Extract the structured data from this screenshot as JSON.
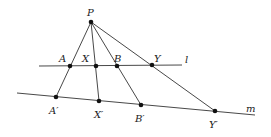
{
  "diagram": {
    "lines": [
      {
        "name": "l",
        "label": "l",
        "from": [
          39,
          66
        ],
        "to": [
          182,
          65
        ],
        "label_pos": [
          185,
          63
        ]
      },
      {
        "name": "m",
        "label": "m",
        "from": [
          17,
          93
        ],
        "to": [
          255,
          115
        ],
        "label_pos": [
          246,
          112
        ]
      }
    ],
    "points": [
      {
        "id": "P",
        "label": "P",
        "x": 91,
        "y": 22,
        "label_pos": [
          87,
          16
        ]
      },
      {
        "id": "A",
        "label": "A",
        "x": 70,
        "y": 66,
        "label_pos": [
          59,
          62
        ]
      },
      {
        "id": "X",
        "label": "X",
        "x": 96,
        "y": 66,
        "label_pos": [
          82,
          62
        ]
      },
      {
        "id": "B",
        "label": "B",
        "x": 117,
        "y": 66,
        "label_pos": [
          114,
          62
        ]
      },
      {
        "id": "Y",
        "label": "Y",
        "x": 152,
        "y": 65,
        "label_pos": [
          154,
          62
        ]
      },
      {
        "id": "A1",
        "label": "A′",
        "x": 56,
        "y": 97,
        "label_pos": [
          49,
          114
        ]
      },
      {
        "id": "X1",
        "label": "X′",
        "x": 99,
        "y": 101,
        "label_pos": [
          94,
          118
        ]
      },
      {
        "id": "B1",
        "label": "B′",
        "x": 141,
        "y": 105,
        "label_pos": [
          135,
          122
        ]
      },
      {
        "id": "Y1",
        "label": "Y′",
        "x": 215,
        "y": 111,
        "label_pos": [
          209,
          128
        ]
      }
    ],
    "segments": [
      {
        "from": "P",
        "to": "A1"
      },
      {
        "from": "P",
        "to": "X1"
      },
      {
        "from": "P",
        "to": "B1"
      },
      {
        "from": "P",
        "to": "Y1"
      }
    ]
  }
}
